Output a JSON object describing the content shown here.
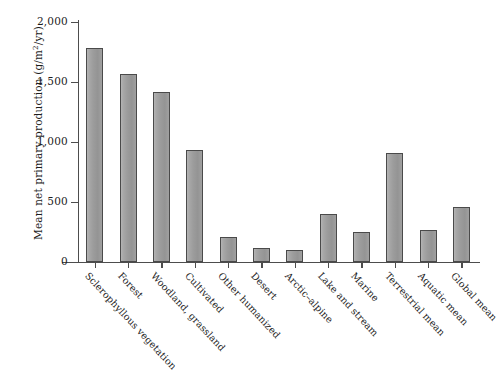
{
  "chart_data": {
    "type": "bar",
    "title": "",
    "xlabel": "",
    "ylabel": "Mean net primary production (g/m2/yr)",
    "ylabel_display": "Mean net primary production (g/m",
    "ylabel_sup": "2",
    "ylabel_tail": "/yr)",
    "ylim": [
      0,
      2000
    ],
    "grid": false,
    "legend": false,
    "ytick_labels": [
      "2,000",
      "1,500",
      "1,000",
      "500",
      "0"
    ],
    "ytick_values": [
      2000,
      1500,
      1000,
      500,
      0
    ],
    "categories": [
      "Sclerophyllous vegetation",
      "Forest",
      "Woodland, grassland",
      "Cultivated",
      "Other humanized",
      "Desert",
      "Arctic–alpine",
      "Lake and stream",
      "Marine",
      "Terrestrial mean",
      "Aquatic mean",
      "Global mean"
    ],
    "values": [
      1780,
      1570,
      1415,
      935,
      210,
      115,
      100,
      400,
      250,
      905,
      265,
      455
    ],
    "bar_fill_color": "#9c9c9c",
    "bar_edge_color": "#4a4a4a",
    "axis_color": "#4d4d4d",
    "background_color": "#ffffff"
  }
}
